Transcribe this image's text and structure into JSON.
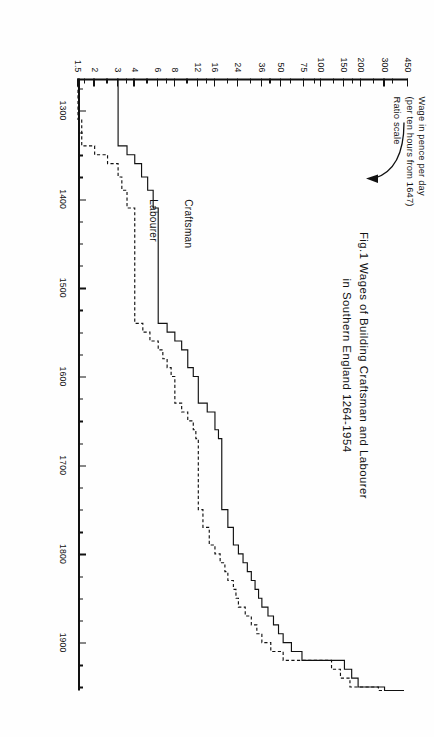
{
  "figure": {
    "title_lines": [
      "Fig.1  Wages of Building  Craftsman  and  Labourer",
      "in Southern  England  1264-1954"
    ],
    "axis_caption_lines": [
      "Wage in pence per day",
      "(per ten hours from 1647)",
      "Ratio scale"
    ],
    "series_labels": {
      "craftsman": "Craftsman",
      "labourer": "Labourer"
    }
  },
  "chart_data": {
    "type": "line",
    "title": "Fig.1  Wages of Building Craftsman and Labourer in Southern England 1264-1954",
    "subtitle": "Wage in pence per day (per ten hours from 1647)",
    "xlabel": "",
    "ylabel": "Wage in pence per day",
    "yscale": "log",
    "yscale_note": "Ratio scale",
    "grid": false,
    "legend_position": "inline-right-of-curves",
    "xlim": [
      1264,
      1954
    ],
    "ylim": [
      1.5,
      450
    ],
    "xticks": [
      1300,
      1400,
      1500,
      1600,
      1700,
      1800,
      1900
    ],
    "xtick_labels": [
      "1300",
      "1400",
      "1500",
      "1600",
      "1700",
      "1800",
      "1900"
    ],
    "xminor_step": 25,
    "yticks": [
      450,
      300,
      200,
      150,
      100,
      75,
      50,
      36,
      24,
      16,
      12,
      8,
      6,
      4,
      3,
      2,
      1.5
    ],
    "ytick_labels": [
      "450",
      "300",
      "200",
      "150",
      "100",
      "75",
      "50",
      "36",
      "24",
      "16",
      "12",
      "8",
      "6",
      "4",
      "3",
      "2",
      "1.5"
    ],
    "series": [
      {
        "name": "Craftsman",
        "linestyle": "solid",
        "x": [
          1264,
          1300,
          1310,
          1340,
          1350,
          1360,
          1375,
          1390,
          1410,
          1420,
          1440,
          1460,
          1480,
          1500,
          1520,
          1540,
          1550,
          1560,
          1570,
          1580,
          1590,
          1600,
          1610,
          1620,
          1630,
          1640,
          1650,
          1660,
          1670,
          1690,
          1710,
          1730,
          1750,
          1770,
          1790,
          1800,
          1810,
          1820,
          1830,
          1840,
          1850,
          1860,
          1870,
          1880,
          1890,
          1900,
          1910,
          1920,
          1930,
          1940,
          1950,
          1954
        ],
        "y": [
          3,
          3,
          3,
          3.5,
          4,
          4.5,
          5,
          5.5,
          6,
          6,
          6,
          6,
          6,
          6,
          6,
          7,
          8,
          9,
          10,
          10,
          11,
          12,
          12,
          12,
          14,
          16,
          16,
          17,
          18,
          18,
          18,
          18,
          20,
          22,
          24,
          26,
          28,
          30,
          32,
          34,
          36,
          40,
          44,
          48,
          52,
          60,
          72,
          150,
          170,
          190,
          300,
          420
        ]
      },
      {
        "name": "Labourer",
        "linestyle": "dashed",
        "x": [
          1264,
          1300,
          1310,
          1340,
          1350,
          1360,
          1375,
          1390,
          1410,
          1420,
          1440,
          1460,
          1480,
          1500,
          1520,
          1540,
          1550,
          1560,
          1570,
          1580,
          1590,
          1600,
          1610,
          1620,
          1630,
          1640,
          1650,
          1660,
          1670,
          1690,
          1710,
          1730,
          1750,
          1770,
          1790,
          1800,
          1810,
          1820,
          1830,
          1840,
          1850,
          1860,
          1870,
          1880,
          1890,
          1900,
          1910,
          1920,
          1930,
          1940,
          1950,
          1954
        ],
        "y": [
          1.5,
          1.5,
          1.6,
          2,
          2.5,
          3,
          3.2,
          3.5,
          4,
          4,
          4,
          4,
          4,
          4,
          4,
          4.6,
          5.2,
          6,
          6.5,
          7,
          7.5,
          8,
          8,
          8,
          9,
          10,
          11,
          11.5,
          12,
          12,
          12,
          12,
          13,
          14.5,
          16,
          17.5,
          19,
          20,
          22,
          23,
          24,
          27,
          30,
          33,
          36,
          42,
          52,
          120,
          140,
          165,
          270,
          390
        ]
      }
    ],
    "annotations": [
      {
        "text": "Craftsman",
        "x": 1400,
        "y": 8.5
      },
      {
        "text": "Labourer",
        "x": 1400,
        "y": 4.6
      }
    ]
  }
}
